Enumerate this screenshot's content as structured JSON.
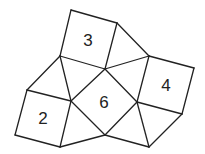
{
  "diagram": {
    "type": "tessellation of squares and triangles",
    "stroke_color": "#222222",
    "background": "#ffffff",
    "vertices": {
      "A": [
        71,
        10
      ],
      "B": [
        117,
        23
      ],
      "C": [
        105,
        69
      ],
      "D": [
        60,
        56
      ],
      "E": [
        149,
        56
      ],
      "F": [
        194,
        68
      ],
      "G": [
        182,
        114
      ],
      "H": [
        137,
        102
      ],
      "I": [
        27,
        90
      ],
      "J": [
        71,
        101
      ],
      "K": [
        60,
        147
      ],
      "L": [
        15,
        135
      ],
      "M": [
        105,
        135
      ],
      "N": [
        149,
        147
      ]
    },
    "squares": [
      {
        "label": "3",
        "vertices": [
          "A",
          "B",
          "C",
          "D"
        ],
        "label_pos": [
          88,
          40
        ]
      },
      {
        "label": "4",
        "vertices": [
          "E",
          "F",
          "G",
          "H"
        ],
        "label_pos": [
          166,
          85
        ]
      },
      {
        "label": "2",
        "vertices": [
          "I",
          "J",
          "K",
          "L"
        ],
        "label_pos": [
          43,
          118
        ]
      },
      {
        "label": "6",
        "vertices": [
          "C",
          "H",
          "M",
          "J"
        ],
        "label_pos": [
          104,
          102
        ]
      }
    ],
    "triangles": [
      [
        "B",
        "E",
        "C"
      ],
      [
        "C",
        "E",
        "H"
      ],
      [
        "D",
        "C",
        "J"
      ],
      [
        "D",
        "J",
        "I"
      ],
      [
        "J",
        "M",
        "K"
      ],
      [
        "M",
        "H",
        "N"
      ],
      [
        "H",
        "G",
        "N"
      ]
    ]
  }
}
